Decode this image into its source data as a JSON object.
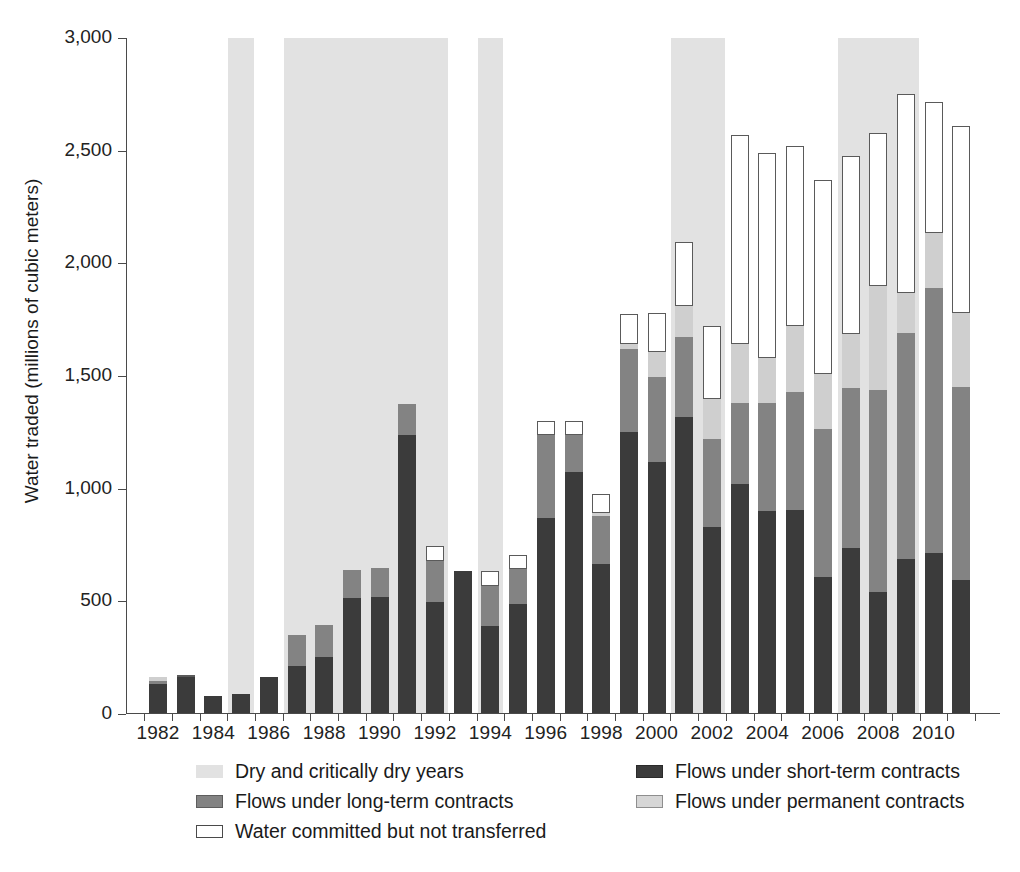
{
  "chart_data": {
    "type": "bar",
    "subtype": "stacked",
    "title": "",
    "xlabel": "",
    "ylabel": "Water traded (millions of cubic meters)",
    "ylim": [
      0,
      3000
    ],
    "ytick_values": [
      0,
      500,
      1000,
      1500,
      2000,
      2500,
      3000
    ],
    "ytick_labels": [
      "0",
      "500",
      "1,000",
      "1,500",
      "2,000",
      "2,500",
      "3,000"
    ],
    "grid": false,
    "legend_position": "below-plot",
    "categories": [
      1982,
      1983,
      1984,
      1985,
      1986,
      1987,
      1988,
      1989,
      1990,
      1991,
      1992,
      1993,
      1994,
      1995,
      1996,
      1997,
      1998,
      1999,
      2000,
      2001,
      2002,
      2003,
      2004,
      2005,
      2006,
      2007,
      2008,
      2009,
      2010,
      2011
    ],
    "xtick_labels": [
      "1982",
      "1984",
      "1986",
      "1988",
      "1990",
      "1992",
      "1994",
      "1996",
      "1998",
      "2000",
      "2002",
      "2004",
      "2006",
      "2008",
      "2010"
    ],
    "series": [
      {
        "name": "Flows under short-term contracts",
        "color": "#3b3b3b",
        "values": [
          135,
          165,
          80,
          90,
          165,
          215,
          255,
          515,
          520,
          1240,
          495,
          635,
          390,
          490,
          870,
          1075,
          665,
          1250,
          1120,
          1320,
          830,
          1020,
          900,
          905,
          610,
          735,
          540,
          690,
          715,
          595
        ]
      },
      {
        "name": "Flows under long-term contracts",
        "color": "#838383",
        "values": [
          10,
          0,
          0,
          0,
          0,
          135,
          140,
          125,
          130,
          135,
          185,
          0,
          180,
          155,
          370,
          165,
          215,
          370,
          375,
          355,
          390,
          360,
          480,
          525,
          655,
          710,
          900,
          1000,
          1175,
          855
        ]
      },
      {
        "name": "Flows under permanent contracts",
        "color": "#cfcfcf",
        "values": [
          20,
          0,
          0,
          0,
          0,
          0,
          0,
          0,
          0,
          0,
          0,
          0,
          0,
          0,
          0,
          0,
          10,
          20,
          110,
          135,
          180,
          260,
          200,
          290,
          245,
          240,
          460,
          180,
          245,
          330
        ]
      },
      {
        "name": "Water committed but not transferred",
        "color": "#ffffff",
        "values": [
          0,
          5,
          0,
          0,
          0,
          0,
          0,
          0,
          0,
          0,
          65,
          0,
          65,
          60,
          60,
          60,
          85,
          135,
          175,
          285,
          320,
          930,
          910,
          800,
          860,
          790,
          680,
          880,
          580,
          830
        ]
      }
    ],
    "totals": [
      165,
      170,
      80,
      90,
      165,
      350,
      395,
      640,
      650,
      1375,
      745,
      635,
      935,
      705,
      1300,
      1300,
      975,
      1775,
      1780,
      2095,
      1720,
      2570,
      2490,
      2520,
      2370,
      2475,
      2580,
      2750,
      2715,
      2610
    ],
    "dry_years": [
      1985,
      1987,
      1988,
      1989,
      1990,
      1991,
      1992,
      1994,
      2001,
      2002,
      2007,
      2008,
      2009
    ],
    "dry_bands": [
      {
        "start": 1985,
        "end": 1985
      },
      {
        "start": 1987,
        "end": 1992
      },
      {
        "start": 1994,
        "end": 1994
      },
      {
        "start": 2001,
        "end": 2002
      },
      {
        "start": 2007,
        "end": 2009
      }
    ],
    "legend": [
      {
        "label": "Dry and critically dry years",
        "swatch": "sw-dry"
      },
      {
        "label": "Flows under short-term contracts",
        "swatch": "sw-short"
      },
      {
        "label": "Flows under long-term contracts",
        "swatch": "sw-long"
      },
      {
        "label": "Flows under permanent contracts",
        "swatch": "sw-perm"
      },
      {
        "label": "Water committed but not transferred",
        "swatch": "sw-commit"
      }
    ]
  }
}
